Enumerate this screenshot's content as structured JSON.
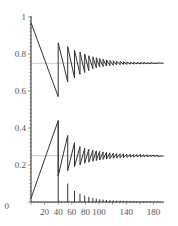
{
  "chart_data": {
    "type": "line",
    "title": "",
    "xlabel": "",
    "ylabel": "",
    "xlim": [
      0,
      195
    ],
    "ylim": [
      0,
      1
    ],
    "grid": false,
    "legend": null,
    "x_ticks": [
      20,
      40,
      60,
      80,
      100,
      140,
      180
    ],
    "x_tick_labels": [
      "20",
      "40",
      "60",
      "80",
      "100",
      "140",
      "180"
    ],
    "y_ticks": [
      0,
      0.2,
      0.4,
      0.6,
      0.8,
      1
    ],
    "y_tick_labels": [
      "0",
      "0.2",
      "0.4",
      "0.6",
      "0.8",
      "1"
    ],
    "reference_lines": [
      {
        "name": "upper-equilibrium",
        "y": 0.75,
        "color": "#bbbbbb"
      },
      {
        "name": "lower-equilibrium",
        "y": 0.25,
        "color": "#bbbbbb"
      }
    ],
    "series": [
      {
        "name": "upper-sawtooth",
        "color": "#333333",
        "description": "Decaying sawtooth oscillation converging to 0.75",
        "x": [
          0,
          40,
          40,
          54,
          54,
          64,
          64,
          72,
          72,
          79,
          79,
          85,
          85,
          91,
          91,
          96,
          96,
          101,
          101,
          106,
          106,
          111,
          111,
          116,
          116,
          121,
          121,
          126,
          126,
          131,
          131,
          136,
          136,
          141,
          141,
          146,
          146,
          151,
          151,
          156,
          156,
          161,
          161,
          166,
          166,
          171,
          171,
          176,
          176,
          181,
          181,
          186,
          186,
          195
        ],
        "y": [
          0.97,
          0.57,
          0.86,
          0.65,
          0.84,
          0.67,
          0.82,
          0.69,
          0.81,
          0.7,
          0.8,
          0.71,
          0.79,
          0.72,
          0.785,
          0.725,
          0.78,
          0.73,
          0.775,
          0.732,
          0.772,
          0.735,
          0.768,
          0.737,
          0.765,
          0.739,
          0.763,
          0.741,
          0.761,
          0.742,
          0.76,
          0.743,
          0.758,
          0.744,
          0.757,
          0.745,
          0.756,
          0.745,
          0.755,
          0.746,
          0.755,
          0.746,
          0.754,
          0.747,
          0.754,
          0.747,
          0.753,
          0.747,
          0.753,
          0.748,
          0.752,
          0.748,
          0.752,
          0.75
        ]
      },
      {
        "name": "lower-sawtooth",
        "color": "#333333",
        "description": "Rising sawtooth oscillation converging to 0.25",
        "x": [
          0,
          40,
          40,
          54,
          54,
          64,
          64,
          72,
          72,
          79,
          79,
          85,
          85,
          91,
          91,
          96,
          96,
          101,
          101,
          106,
          106,
          111,
          111,
          116,
          116,
          121,
          121,
          126,
          126,
          131,
          131,
          136,
          136,
          141,
          141,
          146,
          146,
          151,
          151,
          156,
          156,
          161,
          161,
          166,
          166,
          171,
          171,
          176,
          176,
          181,
          181,
          186,
          186,
          195
        ],
        "y": [
          0.02,
          0.44,
          0.14,
          0.36,
          0.17,
          0.32,
          0.19,
          0.3,
          0.2,
          0.29,
          0.21,
          0.285,
          0.215,
          0.28,
          0.22,
          0.277,
          0.224,
          0.274,
          0.227,
          0.271,
          0.23,
          0.268,
          0.232,
          0.266,
          0.234,
          0.264,
          0.236,
          0.262,
          0.238,
          0.261,
          0.239,
          0.26,
          0.24,
          0.259,
          0.241,
          0.258,
          0.242,
          0.257,
          0.243,
          0.256,
          0.244,
          0.256,
          0.244,
          0.255,
          0.245,
          0.255,
          0.245,
          0.254,
          0.246,
          0.254,
          0.246,
          0.253,
          0.247,
          0.25
        ]
      },
      {
        "name": "impulse-spikes",
        "type": "stem",
        "color": "#333333",
        "x": [
          40,
          54,
          64,
          72,
          79,
          85,
          91,
          96,
          101,
          106,
          111,
          116,
          121,
          126,
          131,
          136,
          141,
          146,
          151,
          156,
          161,
          166,
          171,
          176,
          181,
          186
        ],
        "y": [
          0.44,
          0.1,
          0.06,
          0.045,
          0.035,
          0.028,
          0.022,
          0.018,
          0.015,
          0.013,
          0.011,
          0.01,
          0.009,
          0.008,
          0.007,
          0.006,
          0.006,
          0.005,
          0.005,
          0.004,
          0.004,
          0.004,
          0.003,
          0.003,
          0.003,
          0.003
        ]
      }
    ]
  },
  "layout": {
    "plot_left_px": 31,
    "plot_right_px": 165,
    "y0_px": 202,
    "y1_px": 17,
    "x_scale_px_per_unit": 0.68
  }
}
